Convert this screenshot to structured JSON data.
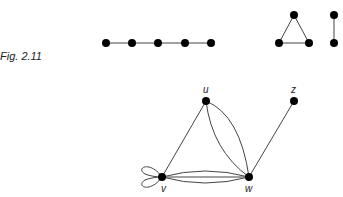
{
  "figure": {
    "caption": "Fig. 2.11",
    "graphs": [
      {
        "name": "path-graph",
        "vertices": [
          [
            106,
            43
          ],
          [
            132,
            43
          ],
          [
            158,
            43
          ],
          [
            185,
            43
          ],
          [
            211,
            43
          ]
        ],
        "edges": [
          [
            0,
            1
          ],
          [
            1,
            2
          ],
          [
            2,
            3
          ],
          [
            3,
            4
          ]
        ]
      },
      {
        "name": "triangle-graph",
        "vertices": [
          [
            294,
            15
          ],
          [
            279,
            43
          ],
          [
            309,
            43
          ]
        ],
        "edges": [
          [
            0,
            1
          ],
          [
            1,
            2
          ],
          [
            2,
            0
          ]
        ]
      },
      {
        "name": "single-edge-graph",
        "vertices": [
          [
            334,
            15
          ],
          [
            334,
            43
          ]
        ],
        "edges": [
          [
            0,
            1
          ]
        ]
      }
    ],
    "multigraph": {
      "vertices": {
        "u": {
          "label": "u",
          "x": 206,
          "y": 101
        },
        "z": {
          "label": "z",
          "x": 294,
          "y": 101
        },
        "v": {
          "label": "v",
          "x": 162,
          "y": 177
        },
        "w": {
          "label": "w",
          "x": 249,
          "y": 177
        }
      },
      "edges": [
        "u-v",
        "u-w (x2)",
        "v-w (x3)",
        "w-z",
        "v-v loop (x2)"
      ]
    }
  }
}
